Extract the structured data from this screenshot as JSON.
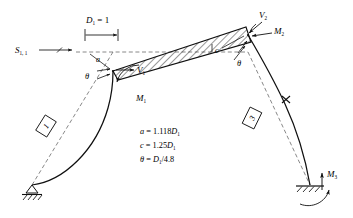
{
  "figure": {
    "colors": {
      "ink": "#101010",
      "dashed": "#6a6a6a",
      "hatch": "#1a1a1a",
      "paper": "#ffffff"
    },
    "dimension": {
      "label_main": "D",
      "label_sub": "1",
      "label_eq": " = 1"
    },
    "load": {
      "symbol": "S",
      "sub": "1, 1"
    },
    "left_joint": {
      "length_label": "a",
      "angle_label": "θ",
      "shear_label": "V",
      "shear_sub": "1",
      "moment_label": "M",
      "moment_sub": "1"
    },
    "right_joint": {
      "length_label": "c",
      "angle_label": "θ",
      "shear_label": "V",
      "shear_sub": "2",
      "moment_label": "M",
      "moment_sub": "2"
    },
    "base_right": {
      "moment_label": "M",
      "moment_sub": "3"
    },
    "members": [
      {
        "id": "1",
        "name": "left-column"
      },
      {
        "id": "3",
        "name": "right-column"
      }
    ],
    "equations": [
      {
        "lhs": "a",
        "rel": " = ",
        "rhs": "1.118",
        "var": "D",
        "var_sub": "1",
        "tail": ""
      },
      {
        "lhs": "c",
        "rel": " = ",
        "rhs": "1.25",
        "var": "D",
        "var_sub": "1",
        "tail": ""
      },
      {
        "lhs": "θ",
        "rel": " = ",
        "rhs": "",
        "var": "D",
        "var_sub": "1",
        "tail": "/4.8"
      }
    ]
  }
}
